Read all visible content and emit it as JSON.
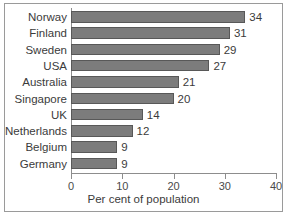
{
  "chart_data": {
    "type": "bar",
    "orientation": "horizontal",
    "title": "",
    "xlabel": "Per cent of population",
    "ylabel": "",
    "categories": [
      "Norway",
      "Finland",
      "Sweden",
      "USA",
      "Australia",
      "Singapore",
      "UK",
      "Netherlands",
      "Belgium",
      "Germany"
    ],
    "values": [
      34,
      31,
      29,
      27,
      21,
      20,
      14,
      12,
      9,
      9
    ],
    "value_labels": [
      "34",
      "31",
      "29",
      "27",
      "21",
      "20",
      "14",
      "12",
      "9",
      "9"
    ],
    "xlim": [
      0,
      40
    ],
    "xticks": [
      0,
      10,
      20,
      30,
      40
    ],
    "xtick_labels": [
      "0",
      "10",
      "20",
      "30",
      "40"
    ],
    "grid": false,
    "legend": null,
    "bar_color": "#7c7c7c",
    "bar_edge_color": "#585858",
    "axis_color": "#8d8d8d",
    "text_color": "#3b3b3b",
    "background": "#ffffff",
    "frame_border_color": "#9a9a9a"
  }
}
